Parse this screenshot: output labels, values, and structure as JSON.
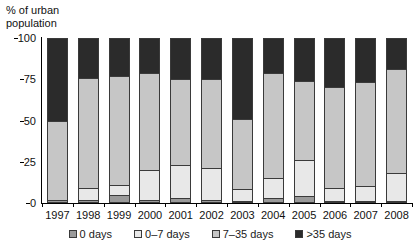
{
  "chart_data": {
    "type": "bar",
    "title": "",
    "subtitle": "",
    "xlabel": "",
    "ylabel": "% of urban\npopulation",
    "ylim": [
      0,
      100
    ],
    "yticks": [
      0,
      25,
      50,
      75,
      100
    ],
    "grid": false,
    "stacked": true,
    "legend_position": "bottom",
    "categories": [
      "1997",
      "1998",
      "1999",
      "2000",
      "2001",
      "2002",
      "2003",
      "2004",
      "2005",
      "2006",
      "2007",
      "2008"
    ],
    "series": [
      {
        "name": "0 days",
        "color": "#9a9a9a",
        "values": [
          2,
          2,
          5,
          2,
          3,
          2,
          1,
          3,
          4,
          1,
          1,
          1
        ]
      },
      {
        "name": "0–7 days",
        "color": "#e8e8e8",
        "values": [
          0,
          7,
          6,
          18,
          20,
          19,
          7,
          12,
          22,
          8,
          9,
          17
        ]
      },
      {
        "name": "7–35 days",
        "color": "#c6c6c6",
        "values": [
          48,
          67,
          66,
          59,
          52,
          54,
          43,
          64,
          48,
          61,
          63,
          63
        ]
      },
      {
        "name": ">35 days",
        "color": "#2b2b2b",
        "values": [
          50,
          24,
          23,
          21,
          25,
          25,
          49,
          21,
          26,
          30,
          27,
          19
        ]
      }
    ]
  },
  "legend": {
    "items": [
      {
        "label": "0 days",
        "color": "#9a9a9a"
      },
      {
        "label": "0–7 days",
        "color": "#e8e8e8"
      },
      {
        "label": "7–35 days",
        "color": "#c6c6c6"
      },
      {
        "label": ">35 days",
        "color": "#2b2b2b"
      }
    ]
  }
}
